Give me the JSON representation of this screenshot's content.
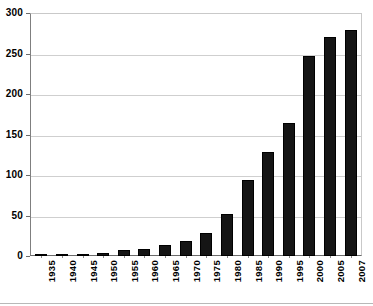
{
  "chart_data": {
    "type": "bar",
    "title": "",
    "subtitle": "",
    "xlabel": "",
    "ylabel": "",
    "categories": [
      "1935",
      "1940",
      "1945",
      "1950",
      "1955",
      "1960",
      "1965",
      "1970",
      "1975",
      "1980",
      "1985",
      "1990",
      "1995",
      "2000",
      "2005",
      "2007"
    ],
    "values": [
      1,
      1,
      2,
      4,
      7,
      9,
      14,
      18,
      28,
      52,
      94,
      128,
      164,
      247,
      270,
      279
    ],
    "series": [
      {
        "name": "",
        "values": [
          1,
          1,
          2,
          4,
          7,
          9,
          14,
          18,
          28,
          52,
          94,
          128,
          164,
          247,
          270,
          279
        ]
      }
    ],
    "ylim": [
      0,
      300
    ],
    "ytick_labels": [
      "0",
      "50",
      "100",
      "150",
      "200",
      "250",
      "300"
    ],
    "ytick_values": [
      0,
      50,
      100,
      150,
      200,
      250,
      300
    ],
    "grid": true,
    "grid_axis": "y",
    "legend": false,
    "legend_position": "none",
    "bar_color": "#151515",
    "grid_color": "#cfcfcf",
    "axis_color": "#6b6b6b",
    "background_color": "#ffffff",
    "xtick_label_rotation": 90,
    "annotations": []
  }
}
